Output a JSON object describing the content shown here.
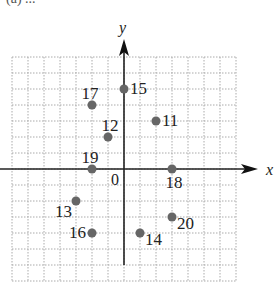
{
  "figure": {
    "caption_partial": "(a) ...",
    "x_axis_label": "x",
    "y_axis_label": "y",
    "origin_label": "0",
    "grid": {
      "x_min": -7,
      "x_max": 7,
      "y_min": -7,
      "y_max": 7,
      "step": 1,
      "style": "dotted"
    },
    "colors": {
      "point": "#666666",
      "axis": "#222222",
      "grid": "#aaaaaa"
    }
  },
  "points": [
    {
      "label": "15",
      "x": 0,
      "y": 5,
      "label_pos": "right"
    },
    {
      "label": "17",
      "x": -2,
      "y": 4,
      "label_pos": "top-left"
    },
    {
      "label": "11",
      "x": 2,
      "y": 3,
      "label_pos": "right"
    },
    {
      "label": "12",
      "x": -1,
      "y": 2,
      "label_pos": "top-right"
    },
    {
      "label": "19",
      "x": -2,
      "y": 0,
      "label_pos": "top-left"
    },
    {
      "label": "18",
      "x": 3,
      "y": 0,
      "label_pos": "bottom"
    },
    {
      "label": "13",
      "x": -3,
      "y": -2,
      "label_pos": "bottom-left"
    },
    {
      "label": "16",
      "x": -2,
      "y": -4,
      "label_pos": "left"
    },
    {
      "label": "14",
      "x": 1,
      "y": -4,
      "label_pos": "bottom-right"
    },
    {
      "label": "20",
      "x": 3,
      "y": -3,
      "label_pos": "bottom-right"
    }
  ]
}
